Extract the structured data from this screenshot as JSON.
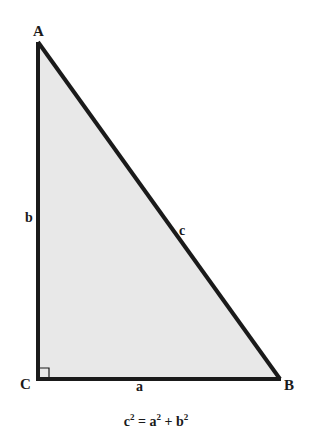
{
  "diagram": {
    "type": "right-triangle",
    "fill_color": "#e8e8e8",
    "stroke_color": "#1a1a1a",
    "vertices": {
      "A": {
        "label": "A",
        "x": 38,
        "y": 42
      },
      "B": {
        "label": "B",
        "x": 280,
        "y": 379
      },
      "C": {
        "label": "C",
        "x": 38,
        "y": 379
      }
    },
    "sides": {
      "a": {
        "label": "a",
        "between": "C-B"
      },
      "b": {
        "label": "b",
        "between": "C-A"
      },
      "c": {
        "label": "c",
        "between": "A-B"
      }
    },
    "right_angle_at": "C"
  },
  "formula": {
    "lhs_base": "c",
    "lhs_exp": "2",
    "equals": " = ",
    "term1_base": "a",
    "term1_exp": "2",
    "plus": " + ",
    "term2_base": "b",
    "term2_exp": "2"
  }
}
